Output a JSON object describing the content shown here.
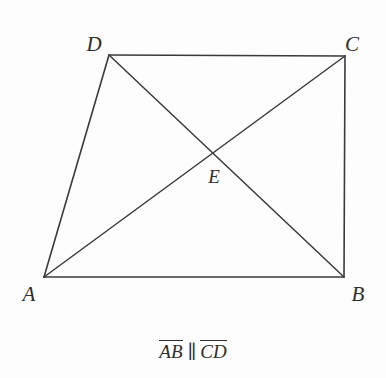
{
  "figure": {
    "type": "geometry-diagram",
    "shape": "quadrilateral-with-diagonals",
    "background_color": "#fdfdfd",
    "stroke_color": "#3a3a3a",
    "label_color": "#2e2e2e",
    "width": 386,
    "height": 378
  },
  "vertices": [
    {
      "name": "A",
      "label": "A",
      "x": 44,
      "y": 277,
      "label_x": 29,
      "label_y": 294
    },
    {
      "name": "B",
      "label": "B",
      "x": 344,
      "y": 277,
      "label_x": 358,
      "label_y": 294
    },
    {
      "name": "C",
      "label": "C",
      "x": 345,
      "y": 56,
      "label_x": 352,
      "label_y": 44
    },
    {
      "name": "D",
      "label": "D",
      "x": 109,
      "y": 55,
      "label_x": 94,
      "label_y": 44
    }
  ],
  "points": [
    {
      "name": "E",
      "label": "E",
      "x": 210,
      "y": 155,
      "label_x": 214,
      "label_y": 176,
      "description": "intersection-of-diagonals"
    }
  ],
  "segments": [
    {
      "name": "side-AB",
      "from": "A",
      "to": "B"
    },
    {
      "name": "side-BC",
      "from": "B",
      "to": "C"
    },
    {
      "name": "side-CD",
      "from": "C",
      "to": "D"
    },
    {
      "name": "side-DA",
      "from": "D",
      "to": "A"
    },
    {
      "name": "diagonal-AC",
      "from": "A",
      "to": "C"
    },
    {
      "name": "diagonal-DB",
      "from": "D",
      "to": "B"
    }
  ],
  "caption": {
    "full_text": "AB ∥ CD",
    "first_segment": "AB",
    "relation_symbol": "∥",
    "second_segment": "CD"
  }
}
